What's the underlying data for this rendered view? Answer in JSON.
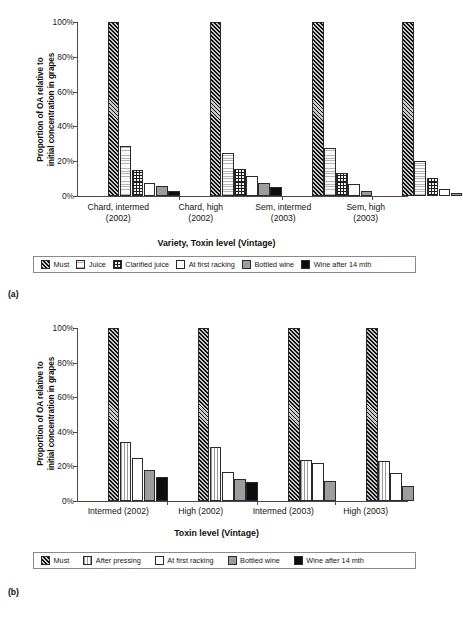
{
  "figure_a": {
    "caption": "(a)",
    "ylabel_line1": "Proportion of OA relative to",
    "ylabel_line2": "initial concentration in grapes",
    "xtitle": "Variety, Toxin level (Vintage)",
    "yticks": [
      "0%",
      "20%",
      "40%",
      "60%",
      "80%",
      "100%"
    ],
    "groups": [
      {
        "line1": "Chard, intermed",
        "line2": "(2002)"
      },
      {
        "line1": "Chard, high",
        "line2": "(2002)"
      },
      {
        "line1": "Sem, intermed",
        "line2": "(2003)"
      },
      {
        "line1": "Sem, high",
        "line2": "(2003)"
      }
    ],
    "legend": [
      {
        "label": "Must",
        "pattern": "p-must",
        "icon": "diagonal-hatch-swatch"
      },
      {
        "label": "Juice",
        "pattern": "p-juice",
        "icon": "horizontal-lines-swatch"
      },
      {
        "label": "Clarified juice",
        "pattern": "p-clarified",
        "icon": "grid-checker-swatch"
      },
      {
        "label": "At first racking",
        "pattern": "p-white",
        "icon": "white-fill-swatch"
      },
      {
        "label": "Bottled wine",
        "pattern": "p-bottled",
        "icon": "grey-fill-swatch"
      },
      {
        "label": "Wine after 14 mth",
        "pattern": "p-aged",
        "icon": "black-fill-swatch"
      }
    ]
  },
  "figure_b": {
    "caption": "(b)",
    "ylabel_line1": "Proportion of OA relative to",
    "ylabel_line2": "initial concentration in grapes",
    "xtitle": "Toxin level (Vintage)",
    "yticks": [
      "0%",
      "20%",
      "40%",
      "60%",
      "80%",
      "100%"
    ],
    "groups": [
      {
        "line1": "Intermed (2002)",
        "line2": ""
      },
      {
        "line1": "High (2002)",
        "line2": ""
      },
      {
        "line1": "Intermed (2003)",
        "line2": ""
      },
      {
        "line1": "High (2003)",
        "line2": ""
      }
    ],
    "legend": [
      {
        "label": "Must",
        "pattern": "p-must",
        "icon": "diagonal-hatch-swatch"
      },
      {
        "label": "After pressing",
        "pattern": "p-pressing",
        "icon": "vertical-lines-swatch"
      },
      {
        "label": "At first racking",
        "pattern": "p-white",
        "icon": "white-fill-swatch"
      },
      {
        "label": "Bottled wine",
        "pattern": "p-bottled",
        "icon": "grey-fill-swatch"
      },
      {
        "label": "Wine after 14 mth",
        "pattern": "p-aged",
        "icon": "black-fill-swatch"
      }
    ]
  },
  "chart_data": [
    {
      "type": "bar",
      "panel": "a",
      "title": "",
      "xlabel": "Variety, Toxin level (Vintage)",
      "ylabel": "Proportion of OA relative to initial concentration in grapes",
      "ylim": [
        0,
        100
      ],
      "yticks": [
        0,
        20,
        40,
        60,
        80,
        100
      ],
      "grid": false,
      "legend_position": "below",
      "categories": [
        "Chard, intermed (2002)",
        "Chard, high (2002)",
        "Sem, intermed (2003)",
        "Sem, high (2003)"
      ],
      "series": [
        {
          "name": "Must",
          "pattern": "p-must",
          "values": [
            100,
            100,
            100,
            100
          ]
        },
        {
          "name": "Juice",
          "pattern": "p-juice",
          "values": [
            29,
            25,
            27.5,
            20
          ]
        },
        {
          "name": "Clarified juice",
          "pattern": "p-clarified",
          "values": [
            15,
            15.5,
            13.5,
            10.5
          ]
        },
        {
          "name": "At first racking",
          "pattern": "p-white",
          "values": [
            7.5,
            11.5,
            7,
            4
          ]
        },
        {
          "name": "Bottled wine",
          "pattern": "p-bottled",
          "values": [
            6,
            7.5,
            3,
            1.5
          ]
        },
        {
          "name": "Wine after 14 mth",
          "pattern": "p-aged",
          "values": [
            3,
            5,
            0,
            0
          ]
        }
      ]
    },
    {
      "type": "bar",
      "panel": "b",
      "title": "",
      "xlabel": "Toxin level (Vintage)",
      "ylabel": "Proportion of OA relative to initial concentration in grapes",
      "ylim": [
        0,
        100
      ],
      "yticks": [
        0,
        20,
        40,
        60,
        80,
        100
      ],
      "grid": false,
      "legend_position": "below",
      "categories": [
        "Intermed (2002)",
        "High (2002)",
        "Intermed (2003)",
        "High (2003)"
      ],
      "series": [
        {
          "name": "Must",
          "pattern": "p-must",
          "values": [
            100,
            100,
            100,
            100
          ]
        },
        {
          "name": "After pressing",
          "pattern": "p-pressing",
          "values": [
            34,
            31,
            23.5,
            23
          ]
        },
        {
          "name": "At first racking",
          "pattern": "p-white",
          "values": [
            25,
            17,
            22,
            16
          ]
        },
        {
          "name": "Bottled wine",
          "pattern": "p-bottled",
          "values": [
            18,
            13,
            11.5,
            8.5
          ]
        },
        {
          "name": "Wine after 14 mth",
          "pattern": "p-aged",
          "values": [
            14,
            11,
            0,
            0
          ]
        }
      ]
    }
  ]
}
